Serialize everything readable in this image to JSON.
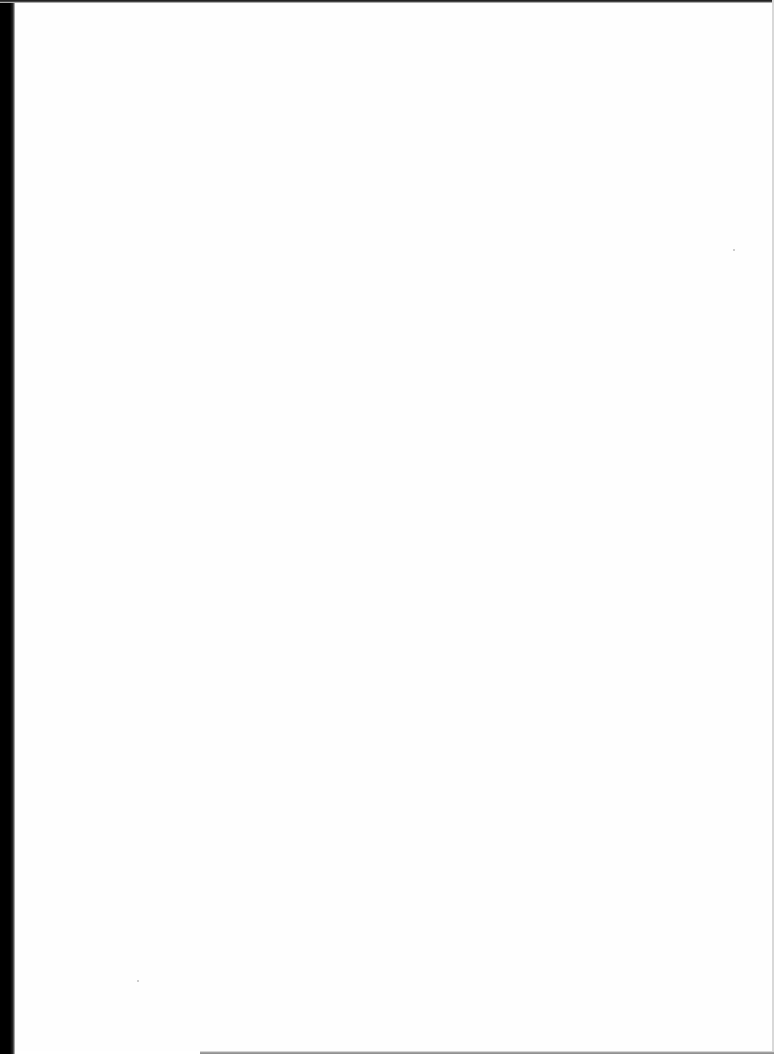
{
  "document": {
    "type": "scanned-page",
    "content": "",
    "blank": true
  },
  "colors": {
    "paper": "#ffffff",
    "edge": "#000000"
  }
}
